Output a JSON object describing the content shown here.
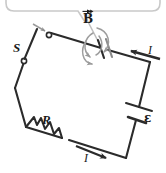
{
  "figure": {
    "kind": "physics-circuit-diagram",
    "background_color": "#ffffff",
    "wire_color": "#2b2b2b",
    "accent_gray": "#9a9a9a",
    "callout_color": "#c9c9c9"
  },
  "labels": {
    "switch": "S",
    "resistor": "R",
    "emf": "ε",
    "magnetic_field": "B",
    "current_top": "I",
    "current_bottom": "I"
  },
  "components": [
    {
      "id": "switch",
      "name": "switch",
      "label": "S",
      "symbol": "open-knife-switch"
    },
    {
      "id": "capacitor",
      "name": "capacitor",
      "label": "",
      "symbol": "parallel-plates"
    },
    {
      "id": "resistor",
      "name": "resistor",
      "label": "R",
      "symbol": "zigzag"
    },
    {
      "id": "battery",
      "name": "battery",
      "label": "ε",
      "symbol": "cell-long-short-plate"
    }
  ],
  "annotations": {
    "field_vector_label": "B",
    "field_vector_has_arrow": true,
    "field_circulation": "curved gray arrows encircling the capacitor axis",
    "switch_motion_hint": "small gray arrow indicating the switch blade closing",
    "current_direction_top": "leftward along the top-right wire toward the capacitor",
    "current_direction_bottom": "rightward along the bottom wire toward the battery corner",
    "callout": "rounded gray callout box at top edge with leader line to the capacitor"
  }
}
